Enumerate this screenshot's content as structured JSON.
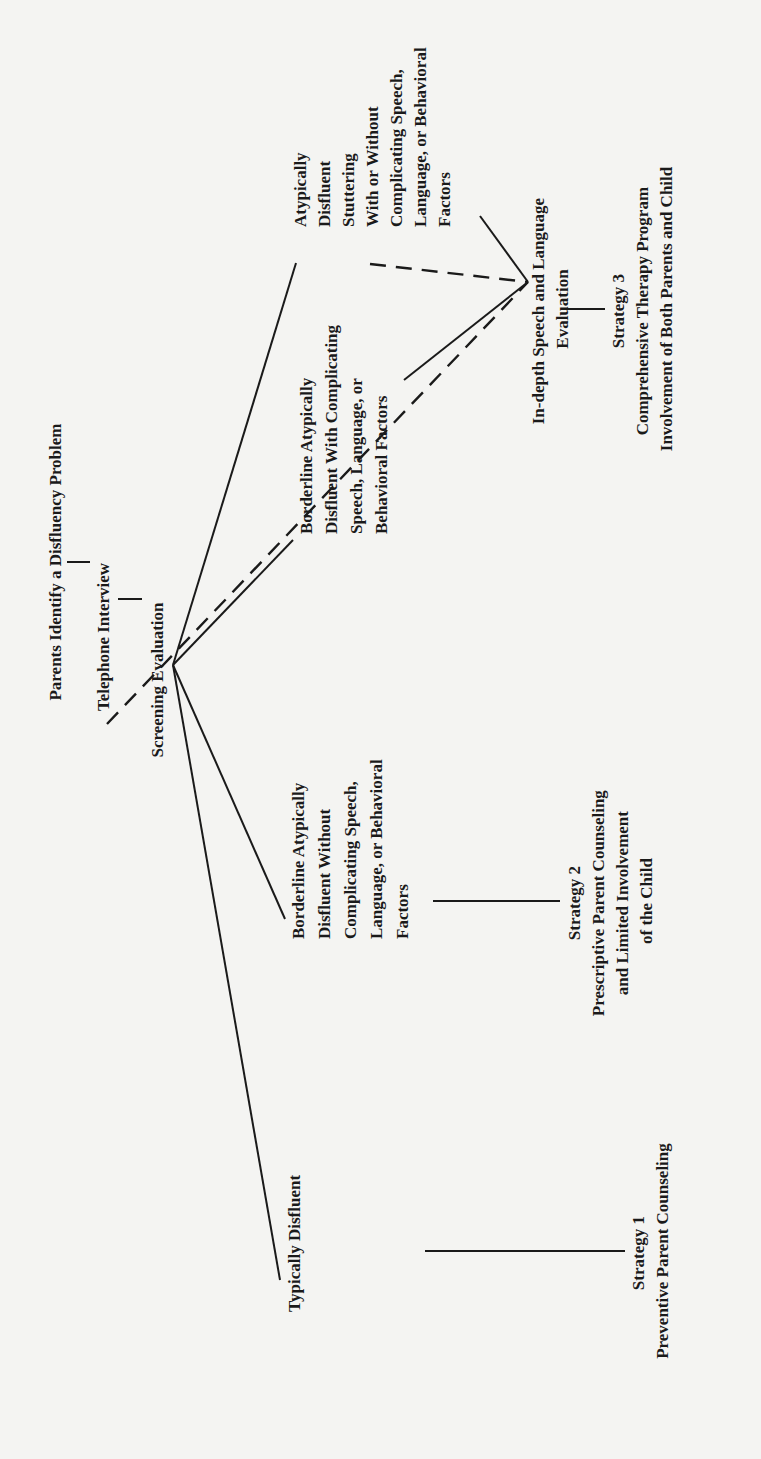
{
  "diagram": {
    "orientation": "rotated-90-ccw",
    "nodes": {
      "parents": {
        "lines": [
          "Parents Identify a Disfluency Problem"
        ]
      },
      "telephone": {
        "lines": [
          "Telephone Interview"
        ]
      },
      "screening": {
        "lines": [
          "Screening Evaluation"
        ]
      },
      "typically": {
        "lines": [
          "Typically Disfluent"
        ]
      },
      "borderline_without": {
        "lines": [
          "Borderline Atypically",
          "Disfluent Without",
          "Complicating Speech,",
          "Language, or Behavioral",
          "Factors"
        ]
      },
      "borderline_with": {
        "lines": [
          "Borderline Atypically",
          "Disfluent With Complicating",
          "Speech, Language, or",
          "Behavioral Factors"
        ]
      },
      "atypically": {
        "lines": [
          "Atypically",
          "Disfluent",
          "Stuttering",
          "With or Without",
          "Complicating Speech,",
          "Language, or Behavioral",
          "Factors"
        ]
      },
      "indepth": {
        "lines": [
          "In-depth Speech and Language",
          "Evaluation"
        ]
      },
      "strategy1": {
        "lines": [
          "Strategy 1",
          "Preventive Parent Counseling"
        ]
      },
      "strategy2": {
        "lines": [
          "Strategy 2",
          "Prescriptive Parent Counseling",
          "and Limited Involvement",
          "of the Child"
        ]
      },
      "strategy3": {
        "lines": [
          "Strategy 3",
          "Comprehensive Therapy Program",
          "Involvement of Both Parents and Child"
        ]
      }
    },
    "edges": [
      {
        "from": "parents",
        "to": "telephone",
        "style": "solid"
      },
      {
        "from": "telephone",
        "to": "screening",
        "style": "solid"
      },
      {
        "from": "telephone",
        "to": "indepth",
        "style": "dashed"
      },
      {
        "from": "screening",
        "to": "typically",
        "style": "solid"
      },
      {
        "from": "screening",
        "to": "borderline_without",
        "style": "solid"
      },
      {
        "from": "screening",
        "to": "borderline_with",
        "style": "solid"
      },
      {
        "from": "screening",
        "to": "atypically",
        "style": "solid"
      },
      {
        "from": "borderline_with",
        "to": "indepth",
        "style": "solid"
      },
      {
        "from": "borderline_with",
        "to": "indepth",
        "style": "dashed"
      },
      {
        "from": "atypically",
        "to": "indepth",
        "style": "solid"
      },
      {
        "from": "typically",
        "to": "strategy1",
        "style": "solid"
      },
      {
        "from": "borderline_without",
        "to": "strategy2",
        "style": "solid"
      },
      {
        "from": "indepth",
        "to": "strategy3",
        "style": "solid"
      }
    ]
  }
}
